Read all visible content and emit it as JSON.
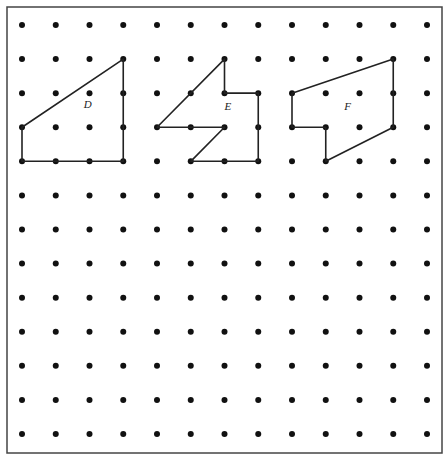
{
  "figure": {
    "frame": {
      "x": 7,
      "y": 7,
      "width": 435,
      "height": 446,
      "stroke": "#444444"
    },
    "grid": {
      "cols": 13,
      "rows": 13,
      "origin_x": 22,
      "origin_y": 25,
      "spacing_x": 33.75,
      "spacing_y": 34.08,
      "dot_radius": 3,
      "dot_color": "#111111"
    },
    "shapes": [
      {
        "label": "D",
        "vertices": [
          [
            0,
            3
          ],
          [
            3,
            1
          ],
          [
            3,
            4
          ],
          [
            0,
            4
          ]
        ],
        "label_pos": [
          1.95,
          2.45
        ]
      },
      {
        "label": "E",
        "vertices": [
          [
            4,
            3
          ],
          [
            6,
            1
          ],
          [
            6,
            2
          ],
          [
            7,
            2
          ],
          [
            7,
            4
          ],
          [
            5,
            4
          ],
          [
            6,
            3
          ]
        ],
        "label_pos": [
          6.1,
          2.5
        ]
      },
      {
        "label": "F",
        "vertices": [
          [
            8,
            2
          ],
          [
            11,
            1
          ],
          [
            11,
            3
          ],
          [
            9,
            4
          ],
          [
            9,
            3
          ],
          [
            8,
            3
          ]
        ],
        "label_pos": [
          9.65,
          2.5
        ]
      }
    ],
    "line_color": "#222222"
  }
}
